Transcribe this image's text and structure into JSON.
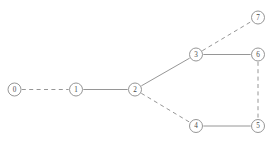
{
  "figure": {
    "width": 277,
    "height": 143,
    "background_color": "#ffffff",
    "stroke_color": "#8a8a8a",
    "node_fill_color": "#ffffff",
    "label_color": "#4a4a4a",
    "node_radius": 6.5
  },
  "chart_data": {
    "type": "diagram",
    "diagram_kind": "node-link-graph",
    "title": "",
    "xlabel": "",
    "ylabel": "",
    "grid": false,
    "legend": null,
    "nodes": [
      {
        "id": "0",
        "label": "0",
        "x": 14.5,
        "y": 89.5
      },
      {
        "id": "1",
        "label": "1",
        "x": 76.0,
        "y": 89.5
      },
      {
        "id": "2",
        "label": "2",
        "x": 135.0,
        "y": 89.5
      },
      {
        "id": "3",
        "label": "3",
        "x": 196.0,
        "y": 54.5
      },
      {
        "id": "4",
        "label": "4",
        "x": 196.0,
        "y": 126.0
      },
      {
        "id": "5",
        "label": "5",
        "x": 258.0,
        "y": 126.0
      },
      {
        "id": "6",
        "label": "6",
        "x": 258.0,
        "y": 54.5
      },
      {
        "id": "7",
        "label": "7",
        "x": 258.0,
        "y": 17.5
      }
    ],
    "edges": [
      {
        "source": "0",
        "target": "1",
        "style": "dashed"
      },
      {
        "source": "1",
        "target": "2",
        "style": "solid"
      },
      {
        "source": "2",
        "target": "3",
        "style": "solid"
      },
      {
        "source": "2",
        "target": "4",
        "style": "dashed"
      },
      {
        "source": "3",
        "target": "7",
        "style": "dashed"
      },
      {
        "source": "3",
        "target": "6",
        "style": "solid"
      },
      {
        "source": "6",
        "target": "5",
        "style": "dashed"
      },
      {
        "source": "4",
        "target": "5",
        "style": "solid"
      }
    ]
  }
}
